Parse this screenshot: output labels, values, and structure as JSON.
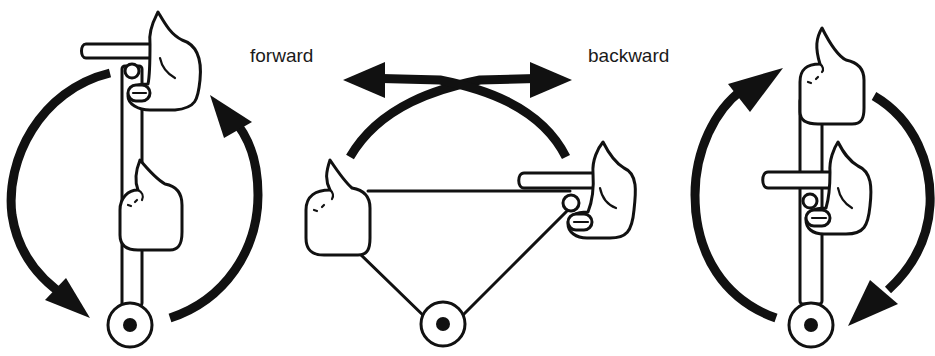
{
  "labels": {
    "forward": "forward",
    "backward": "backward"
  },
  "figures": [
    {
      "id": "left",
      "description": "Vertical rod with pointing hand grip at top and fist mid-rod; circular arrows showing forward rotation (counterclockwise on left, clockwise on right side)"
    },
    {
      "id": "middle",
      "description": "Triangle linkage with fist on left and pointing hand on right; crossed arc arrows indicating forward and backward motion"
    },
    {
      "id": "right",
      "description": "Vertical rod with fist at top and pointing hand grip mid-rod; circular arrows showing backward rotation"
    }
  ],
  "colors": {
    "ink": "#111111",
    "background": "#ffffff"
  }
}
